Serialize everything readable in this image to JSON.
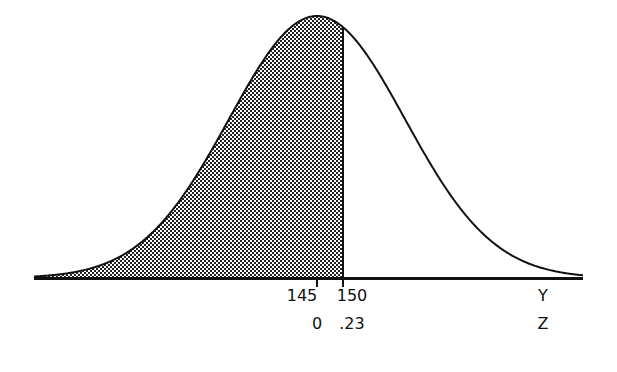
{
  "diagram": {
    "type": "normal-distribution-shaded-area",
    "mean_label": "145",
    "cutoff_label": "150",
    "mean_z_label": "0",
    "cutoff_z_label": ".23",
    "x_axis_label_top": "Y",
    "x_axis_label_bottom": "Z",
    "shaded_region": "left of 150",
    "colors": {
      "line": "#111111",
      "background": "#ffffff",
      "shade_dark": "#222222",
      "shade_light": "#ffffff"
    }
  },
  "chart_data": {
    "type": "area",
    "title": "",
    "xlabel": "Y / Z",
    "ylabel": "",
    "distribution": "normal",
    "mean": 145,
    "cutoff": 150,
    "z_at_mean": 0,
    "z_at_cutoff": 0.23,
    "shaded": "area below cutoff (Y < 150)",
    "tick_labels_y": [
      "145",
      "150",
      "Y"
    ],
    "tick_labels_z": [
      "0",
      ".23",
      "Z"
    ],
    "grid": false,
    "legend": false
  }
}
